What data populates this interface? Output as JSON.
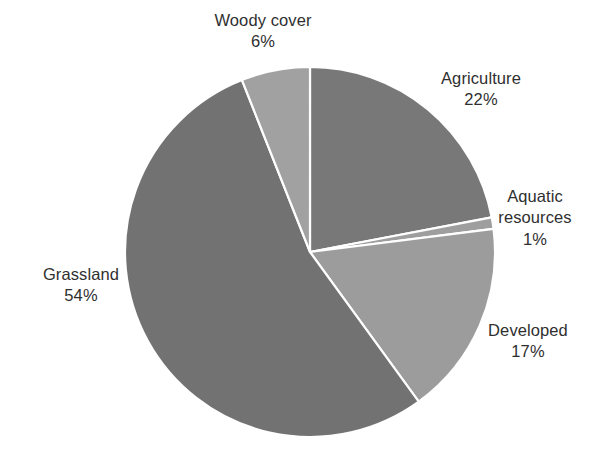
{
  "chart_data": {
    "type": "pie",
    "title": "",
    "subtitle": "",
    "xlabel": "",
    "ylabel": "",
    "legend_position": "none",
    "grid": false,
    "labels_inline": true,
    "unit": "%",
    "center": {
      "x": 310,
      "y": 252
    },
    "radius": 185,
    "start_angle_deg": 0,
    "direction": "clockwise",
    "categories": [
      "Agriculture",
      "Aquatic resources",
      "Developed",
      "Grassland",
      "Woody cover"
    ],
    "values": [
      22,
      1,
      17,
      54,
      6
    ],
    "slices": [
      {
        "name": "Agriculture",
        "value": 22,
        "value_text": "22%",
        "color": "#5f5f5f",
        "start_deg": 0,
        "end_deg": 79.2,
        "label_lines": [
          "Agriculture",
          "22%"
        ]
      },
      {
        "name": "Aquatic resources",
        "value": 1,
        "value_text": "1%",
        "color": "#8c8c8c",
        "start_deg": 79.2,
        "end_deg": 82.8,
        "label_lines": [
          "Aquatic",
          "resources",
          "1%"
        ]
      },
      {
        "name": "Developed",
        "value": 17,
        "value_text": "17%",
        "color": "#8a8a8a",
        "start_deg": 82.8,
        "end_deg": 144.0,
        "label_lines": [
          "Developed",
          "17%"
        ]
      },
      {
        "name": "Grassland",
        "value": 54,
        "value_text": "54%",
        "color": "#585858",
        "start_deg": 144.0,
        "end_deg": 338.4,
        "label_lines": [
          "Grassland",
          "54%"
        ]
      },
      {
        "name": "Woody cover",
        "value": 6,
        "value_text": "6%",
        "color": "#909090",
        "start_deg": 338.4,
        "end_deg": 360.0,
        "label_lines": [
          "Woody cover",
          "6%"
        ]
      }
    ],
    "total": 100,
    "slice_border_color": "#ffffff",
    "background_color": "#ffffff",
    "text_color": "#2f2f2f"
  },
  "labels": {
    "woody_cover": {
      "name": "Woody cover",
      "value": "6%"
    },
    "agriculture": {
      "name": "Agriculture",
      "value": "22%"
    },
    "aquatic_resources": {
      "name_line1": "Aquatic",
      "name_line2": "resources",
      "value": "1%"
    },
    "developed": {
      "name": "Developed",
      "value": "17%"
    },
    "grassland": {
      "name": "Grassland",
      "value": "54%"
    }
  }
}
